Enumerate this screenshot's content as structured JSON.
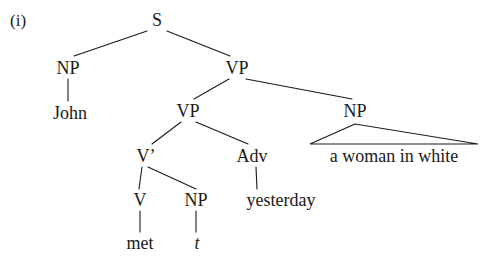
{
  "figure": {
    "enumerator": "(i)",
    "sentence": "John met t a woman in white yesterday",
    "background_color": "#ffffff",
    "ink_color": "#1a1a1a"
  },
  "nodes": {
    "s": {
      "label": "S",
      "x": 157,
      "y": 20
    },
    "np_subject": {
      "label": "NP",
      "x": 68,
      "y": 68
    },
    "john": {
      "label": "John",
      "x": 70,
      "y": 113
    },
    "vp_outer": {
      "label": "VP",
      "x": 237,
      "y": 68
    },
    "vp_inner": {
      "label": "VP",
      "x": 188,
      "y": 111
    },
    "np_object": {
      "label": "NP",
      "x": 355,
      "y": 111
    },
    "v_bar": {
      "label": "V’",
      "x": 146,
      "y": 156
    },
    "adv": {
      "label": "Adv",
      "x": 252,
      "y": 156
    },
    "a_woman_in_white": {
      "label": "a woman in white",
      "x": 394,
      "y": 156
    },
    "v": {
      "label": "V",
      "x": 140,
      "y": 200
    },
    "np_trace": {
      "label": "NP",
      "x": 196,
      "y": 200
    },
    "yesterday": {
      "label": "yesterday",
      "x": 281,
      "y": 200
    },
    "met": {
      "label": "met",
      "x": 140,
      "y": 243
    },
    "trace": {
      "label": "t",
      "x": 197,
      "y": 243
    }
  },
  "branches": [
    {
      "name": "s-to-np-subject",
      "x1": 147,
      "y1": 31,
      "x2": 74,
      "y2": 56
    },
    {
      "name": "s-to-vp-outer",
      "x1": 167,
      "y1": 31,
      "x2": 230,
      "y2": 56
    },
    {
      "name": "np-subject-to-john",
      "x1": 68,
      "y1": 79,
      "x2": 68,
      "y2": 101
    },
    {
      "name": "vp-outer-to-vp-inner",
      "x1": 229,
      "y1": 79,
      "x2": 194,
      "y2": 99
    },
    {
      "name": "vp-outer-to-np-object",
      "x1": 246,
      "y1": 79,
      "x2": 352,
      "y2": 99
    },
    {
      "name": "vp-inner-to-v-bar",
      "x1": 181,
      "y1": 122,
      "x2": 152,
      "y2": 144
    },
    {
      "name": "vp-inner-to-adv",
      "x1": 196,
      "y1": 122,
      "x2": 248,
      "y2": 144
    },
    {
      "name": "v-bar-to-v",
      "x1": 142,
      "y1": 167,
      "x2": 139,
      "y2": 189
    },
    {
      "name": "v-bar-to-np-trace",
      "x1": 148,
      "y1": 167,
      "x2": 196,
      "y2": 189
    },
    {
      "name": "adv-to-yesterday",
      "x1": 256,
      "y1": 167,
      "x2": 257,
      "y2": 189
    },
    {
      "name": "v-to-met",
      "x1": 140,
      "y1": 211,
      "x2": 140,
      "y2": 232
    },
    {
      "name": "np-trace-to-trace",
      "x1": 196,
      "y1": 211,
      "x2": 196,
      "y2": 232
    }
  ],
  "triangle": {
    "name": "np-object-triangle",
    "apex_x": 355,
    "apex_y": 124,
    "base_left_x": 310,
    "base_right_x": 478,
    "base_y": 144
  }
}
